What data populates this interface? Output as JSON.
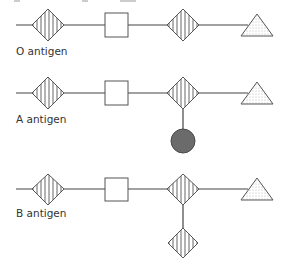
{
  "diagram": {
    "legend_key": {
      "striped_diamond": "sugar-diamond-striped",
      "white_square": "sugar-square-white",
      "dotted_triangle": "sugar-triangle-dotted",
      "gray_circle": "sugar-circle-gray"
    },
    "colors": {
      "line": "#444444",
      "outline": "#555555",
      "circle_fill": "#6b6b6b",
      "circle_stroke": "#4a4a4a",
      "triangle_dots": "#777777",
      "text": "#333333"
    },
    "rows": [
      {
        "id": "o",
        "label": "O antigen",
        "chain": [
          "striped-diamond",
          "white-square",
          "striped-diamond",
          "dotted-triangle"
        ],
        "branch": null
      },
      {
        "id": "a",
        "label": "A antigen",
        "chain": [
          "striped-diamond",
          "white-square",
          "striped-diamond",
          "dotted-triangle"
        ],
        "branch": "gray-circle"
      },
      {
        "id": "b",
        "label": "B antigen",
        "chain": [
          "striped-diamond",
          "white-square",
          "striped-diamond",
          "dotted-triangle"
        ],
        "branch": "striped-diamond"
      }
    ]
  }
}
